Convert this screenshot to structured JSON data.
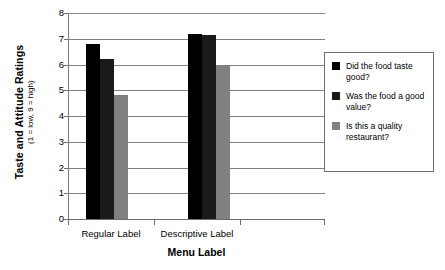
{
  "chart_data": {
    "type": "bar",
    "title": "",
    "subtitle": "",
    "xlabel": "Menu Label",
    "ylabel": "Taste and Attitude Ratings",
    "ylabel_sub": "(1 = low, 9 = high)",
    "categories": [
      "Regular Label",
      "Descriptive Label"
    ],
    "ylim": [
      0,
      8
    ],
    "yticks": [
      0,
      1,
      2,
      3,
      4,
      5,
      6,
      7,
      8
    ],
    "ytick_labels": [
      "0",
      "1",
      "2",
      "3",
      "4",
      "5",
      "6",
      "7",
      "8"
    ],
    "grid": true,
    "legend_position": "right",
    "series": [
      {
        "name": "Did the food taste good?",
        "color": "#000000",
        "values": [
          6.8,
          7.2
        ]
      },
      {
        "name": "Was the food a good value?",
        "color": "#1a1a1a",
        "values": [
          6.2,
          7.15
        ]
      },
      {
        "name": "Is this a quality restaurant?",
        "color": "#808080",
        "values": [
          4.8,
          5.95
        ]
      }
    ]
  },
  "legend": {
    "entries": [
      {
        "label": "Did the food taste good?",
        "swatch": "#000000"
      },
      {
        "label": "Was the food a good value?",
        "swatch": "#1a1a1a"
      },
      {
        "label": "Is this a quality restaurant?",
        "swatch": "#808080"
      }
    ]
  },
  "axes": {
    "y_title_main": "Taste and Attitude Ratings",
    "y_title_sub": "(1 = low, 9 = high)",
    "x_title": "Menu Label",
    "y_tick_0": "0",
    "y_tick_1": "1",
    "y_tick_2": "2",
    "y_tick_3": "3",
    "y_tick_4": "4",
    "y_tick_5": "5",
    "y_tick_6": "6",
    "y_tick_7": "7",
    "y_tick_8": "8",
    "x_cat_0": "Regular Label",
    "x_cat_1": "Descriptive Label"
  }
}
